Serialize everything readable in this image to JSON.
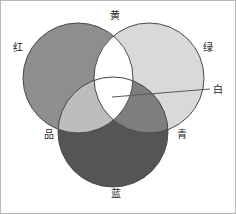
{
  "figure": {
    "title": "",
    "colors": {
      "red_fill": "#8e8e8e",
      "green_fill": "#d9d9d9",
      "blue_fill": "#555555",
      "yellow_overlap": "#ffffff",
      "magenta_overlap": "#bdbdbd",
      "cyan_overlap": "#7e7e7e",
      "white_center": "#ffffff",
      "stroke": "#4a4a4a",
      "leader_line": "#5a5a5a",
      "frame": "#b9b9b9"
    }
  },
  "chart_data": {
    "type": "diagram",
    "subtype": "venn3",
    "title": "",
    "xlabel": "",
    "ylabel": "",
    "grid": false,
    "legend": "none",
    "sets": [
      {
        "key": "red",
        "label": "红",
        "cx": 77,
        "cy": 77,
        "r": 55,
        "fill": "#8e8e8e"
      },
      {
        "key": "green",
        "label": "绿",
        "cx": 148,
        "cy": 77,
        "r": 55,
        "fill": "#d9d9d9"
      },
      {
        "key": "blue",
        "label": "蓝",
        "cx": 112,
        "cy": 131,
        "r": 55,
        "fill": "#555555"
      }
    ],
    "intersections": [
      {
        "key": "yellow",
        "label": "黄",
        "sets": [
          "red",
          "green"
        ],
        "fill": "#ffffff"
      },
      {
        "key": "magenta",
        "label": "品",
        "sets": [
          "red",
          "blue"
        ],
        "fill": "#bdbdbd"
      },
      {
        "key": "cyan",
        "label": "青",
        "sets": [
          "green",
          "blue"
        ],
        "fill": "#7e7e7e"
      },
      {
        "key": "white",
        "label": "白",
        "sets": [
          "red",
          "green",
          "blue"
        ],
        "fill": "#ffffff"
      }
    ],
    "annotations": [
      {
        "key": "white-leader",
        "label": "白",
        "line": {
          "x1": 111,
          "y1": 96,
          "x2": 209,
          "y2": 88
        }
      }
    ]
  },
  "labels": {
    "red": "红",
    "yellow": "黄",
    "green": "绿",
    "magenta": "品",
    "cyan": "青",
    "blue": "蓝",
    "white": "白"
  }
}
